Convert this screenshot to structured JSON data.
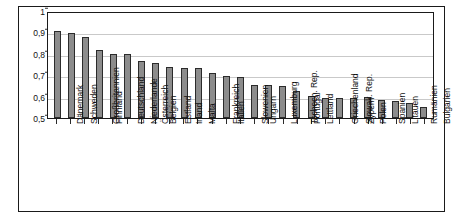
{
  "chart_data": {
    "type": "bar",
    "title": "",
    "subtitle": "",
    "xlabel": "",
    "ylabel": "",
    "ylim": [
      0.5,
      1.0
    ],
    "ytick_labels": [
      "1",
      "0,9",
      "0,8",
      "0,7",
      "0,6",
      "0,5"
    ],
    "ytick_values": [
      1.0,
      0.9,
      0.8,
      0.7,
      0.6,
      0.5
    ],
    "grid": true,
    "legend": false,
    "legend_position": "none",
    "decimal_separator": ",",
    "bar_color": "#8c8c8c",
    "bar_edge_color": "#2b2b2b",
    "gridline_color": "#c9c9c9",
    "axis_color": "#1a1a1a",
    "categories": [
      "Dänemark",
      "Schweden",
      "Großbritannien",
      "Finnland",
      "Deutschland",
      "Niederlande",
      "Österreich",
      "Belgien",
      "Estland",
      "Irland",
      "Malta",
      "Frankreich",
      "Italien",
      "Slowenien",
      "Ungarn",
      "Luxemburg",
      "Tschech. Rep.",
      "Portugal",
      "Lettland",
      "Griechenland",
      "Slowak. Rep.",
      "Zypern",
      "Polen",
      "Spanien",
      "Litauen",
      "Rumänien",
      "Bulgarien"
    ],
    "values": [
      0.905,
      0.895,
      0.88,
      0.82,
      0.8,
      0.8,
      0.765,
      0.755,
      0.74,
      0.735,
      0.735,
      0.71,
      0.695,
      0.69,
      0.655,
      0.655,
      0.65,
      0.625,
      0.605,
      0.595,
      0.595,
      0.595,
      0.6,
      0.585,
      0.58,
      0.57,
      0.55
    ]
  }
}
